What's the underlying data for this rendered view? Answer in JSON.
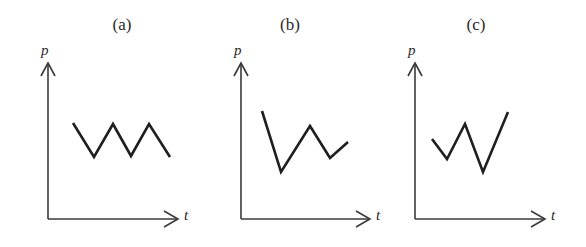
{
  "figure": {
    "background_color": "#ffffff",
    "line_color": "#201f1f",
    "axis_color": "#3a3a3a",
    "width": 586,
    "height": 247
  },
  "chart_data": {
    "type": "line",
    "title": "",
    "subtitle": "",
    "panels": [
      {
        "label": "(a)",
        "label_x": 122,
        "label_y": 27,
        "xlabel": "t",
        "ylabel": "p",
        "grid": false,
        "legend": "none",
        "origin": {
          "x": 48,
          "y": 219
        },
        "y_axis_top": {
          "x": 48,
          "y": 63
        },
        "x_axis_end": {
          "x": 178,
          "y": 219
        },
        "ylabel_pos": {
          "x": 41,
          "y": 42
        },
        "xlabel_pos": {
          "x": 184,
          "y": 207
        },
        "points": [
          {
            "x": 73,
            "y": 123
          },
          {
            "x": 94,
            "y": 157
          },
          {
            "x": 113,
            "y": 124
          },
          {
            "x": 131,
            "y": 156
          },
          {
            "x": 149,
            "y": 124
          },
          {
            "x": 170,
            "y": 157
          }
        ]
      },
      {
        "label": "(b)",
        "label_x": 290,
        "label_y": 27,
        "xlabel": "t",
        "ylabel": "p",
        "grid": false,
        "legend": "none",
        "origin": {
          "x": 241,
          "y": 219
        },
        "y_axis_top": {
          "x": 241,
          "y": 63
        },
        "x_axis_end": {
          "x": 370,
          "y": 219
        },
        "ylabel_pos": {
          "x": 234,
          "y": 42
        },
        "xlabel_pos": {
          "x": 376,
          "y": 207
        },
        "points": [
          {
            "x": 262,
            "y": 111
          },
          {
            "x": 281,
            "y": 172
          },
          {
            "x": 310,
            "y": 126
          },
          {
            "x": 330,
            "y": 158
          },
          {
            "x": 348,
            "y": 142
          }
        ]
      },
      {
        "label": "(c)",
        "label_x": 476,
        "label_y": 27,
        "xlabel": "t",
        "ylabel": "p",
        "grid": false,
        "legend": "none",
        "origin": {
          "x": 415,
          "y": 219
        },
        "y_axis_top": {
          "x": 415,
          "y": 63
        },
        "x_axis_end": {
          "x": 545,
          "y": 219
        },
        "ylabel_pos": {
          "x": 408,
          "y": 42
        },
        "xlabel_pos": {
          "x": 551,
          "y": 207
        },
        "points": [
          {
            "x": 432,
            "y": 139
          },
          {
            "x": 447,
            "y": 159
          },
          {
            "x": 465,
            "y": 124
          },
          {
            "x": 483,
            "y": 172
          },
          {
            "x": 508,
            "y": 112
          }
        ]
      }
    ]
  }
}
